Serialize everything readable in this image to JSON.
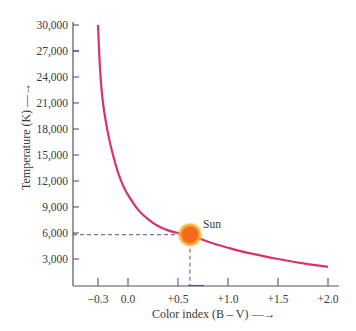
{
  "chart_data": {
    "type": "line",
    "title": "",
    "xlabel": "Color index (B – V)",
    "ylabel": "Temperature (K)",
    "xlim": [
      -0.45,
      2.05
    ],
    "ylim": [
      0,
      30000
    ],
    "grid": false,
    "legend": null,
    "x_ticks": [
      -0.3,
      0.0,
      0.5,
      1.0,
      1.5,
      2.0
    ],
    "x_tick_labels": [
      "−0.3",
      "0.0",
      "+0.5",
      "+1.0",
      "+1.5",
      "+2.0"
    ],
    "y_ticks": [
      3000,
      6000,
      9000,
      12000,
      15000,
      18000,
      21000,
      24000,
      27000,
      30000
    ],
    "y_tick_labels": [
      "3,000",
      "6,000",
      "9,000",
      "12,000",
      "15,000",
      "18,000",
      "21,000",
      "24,000",
      "27,000",
      "30,000"
    ],
    "series": [
      {
        "name": "Temperature vs color index",
        "color": "#d6336c",
        "x": [
          -0.3,
          -0.28,
          -0.25,
          -0.2,
          -0.15,
          -0.1,
          -0.05,
          0.0,
          0.1,
          0.2,
          0.3,
          0.4,
          0.5,
          0.62,
          0.8,
          1.0,
          1.2,
          1.5,
          1.8,
          2.0
        ],
        "y": [
          30000,
          25000,
          21000,
          17500,
          15000,
          13000,
          11500,
          10400,
          8700,
          7600,
          6800,
          6300,
          6000,
          5800,
          5000,
          4300,
          3700,
          3000,
          2400,
          2100
        ]
      }
    ],
    "annotations": [
      {
        "label": "Sun",
        "x": 0.62,
        "y": 5800,
        "marker_color": "#f26a1b",
        "guides": "dashed lines to both axes"
      }
    ]
  },
  "axes": {
    "x_title": "Color index (B – V)",
    "y_title": "Temperature (K)",
    "arrow": "→"
  },
  "sun_label": "Sun"
}
